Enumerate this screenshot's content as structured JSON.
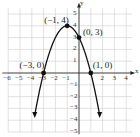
{
  "chart_data": {
    "type": "line",
    "title": "",
    "equation": "y = -(x+1)^2 + 4",
    "xlabel": "x",
    "ylabel": "y",
    "xlim": [
      -6,
      4.5
    ],
    "ylim": [
      -5,
      5.5
    ],
    "grid": true,
    "x_ticks": [
      "-6",
      "-5",
      "-4",
      "-3",
      "-2",
      "-1",
      "2",
      "3",
      "4"
    ],
    "y_ticks": [
      "5",
      "4",
      "3",
      "2",
      "1",
      "-1",
      "-2",
      "-3",
      "-4",
      "-5"
    ],
    "points": [
      {
        "x": -1,
        "y": 4,
        "label": "(−1, 4)"
      },
      {
        "x": 0,
        "y": 3,
        "label": "(0, 3)"
      },
      {
        "x": -3,
        "y": 0,
        "label": "(−3, 0)"
      },
      {
        "x": 1,
        "y": 0,
        "label": "(1, 0)"
      }
    ],
    "colors": {
      "curve": "#111111",
      "grid": "#cccccc",
      "axis": "#222222"
    }
  }
}
